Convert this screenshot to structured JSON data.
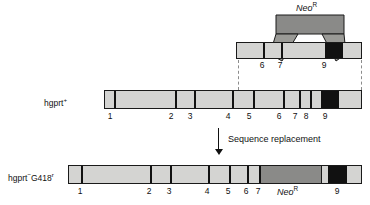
{
  "figure": {
    "title_text": "Sequence replacement",
    "construct_label": "Neo",
    "construct_label_sup": "R",
    "cassette_label": "Neo",
    "cassette_label_sup": "R"
  },
  "colors": {
    "exon_light": "#d4d4d2",
    "neo_gray": "#8a8a88",
    "neo_gray_dark": "#76766f",
    "arm_gray": "#9a9a96",
    "black_exon": "#111111",
    "outline": "#1a1a1a",
    "dashed": "#8c8c8c",
    "text": "#111111"
  },
  "targeting_construct": {
    "name": "Neo-R targeting vector",
    "exon_labels": [
      "6",
      "7",
      "9"
    ],
    "left_arm_label": "6",
    "deleted_label": "7",
    "right_arm_label": "9"
  },
  "wildtype_allele": {
    "label": "hgprt",
    "label_sup": "+",
    "exon_labels": [
      "1",
      "2",
      "3",
      "4",
      "5",
      "6",
      "7",
      "8",
      "9"
    ]
  },
  "targeted_allele": {
    "label_a": "hgprt",
    "label_a_sup": "−",
    "label_b": "G418",
    "label_b_sup": "r",
    "exon_labels": [
      "1",
      "2",
      "3",
      "4",
      "5",
      "6",
      "7",
      "9"
    ],
    "insert_label": "Neo",
    "insert_label_sup": "R"
  }
}
